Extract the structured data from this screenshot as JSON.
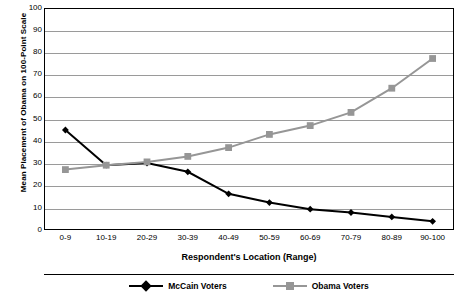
{
  "chart_data": {
    "type": "line",
    "title": "",
    "xlabel": "Respondent's Location (Range)",
    "ylabel": "Mean Placement of Obama on 100-Point Scale",
    "categories": [
      "0-9",
      "10-19",
      "20-29",
      "30-39",
      "40-49",
      "50-59",
      "60-69",
      "70-79",
      "80-89",
      "90-100"
    ],
    "ylim": [
      0,
      100
    ],
    "yticks": [
      0,
      10,
      20,
      30,
      40,
      50,
      60,
      70,
      80,
      90,
      100
    ],
    "grid": true,
    "legend_position": "bottom",
    "series": [
      {
        "name": "McCain Voters",
        "color": "#000000",
        "marker": "diamond",
        "values": [
          45,
          29,
          30,
          26,
          16,
          12,
          9,
          7.5,
          5.5,
          3.5
        ]
      },
      {
        "name": "Obama Voters",
        "color": "#969696",
        "marker": "square",
        "values": [
          27,
          29,
          30.5,
          33,
          37,
          43,
          47,
          53,
          64,
          77.5
        ]
      }
    ]
  },
  "legend": {
    "entries": [
      {
        "label": "McCain Voters"
      },
      {
        "label": "Obama Voters"
      }
    ]
  }
}
